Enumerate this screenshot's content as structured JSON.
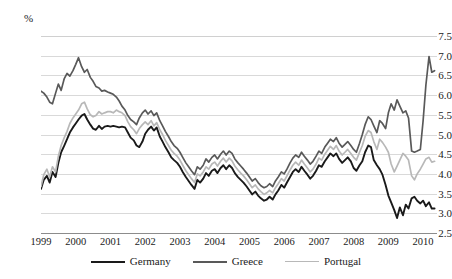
{
  "chart_data": {
    "type": "line",
    "title": "",
    "subtitle": "",
    "xlabel": "",
    "ylabel": "%",
    "unit_label": "%",
    "ylim": [
      2.5,
      7.5
    ],
    "ytick_step": 0.5,
    "yticks": [
      "7.5",
      "7.0",
      "6.5",
      "6.0",
      "5.5",
      "5.0",
      "4.5",
      "4.0",
      "3.5",
      "3.0",
      "2.5"
    ],
    "ytick_values": [
      7.5,
      7.0,
      6.5,
      6.0,
      5.5,
      5.0,
      4.5,
      4.0,
      3.5,
      3.0,
      2.5
    ],
    "xlim": [
      1999,
      2010.4
    ],
    "xticks": [
      "1999",
      "2000",
      "2001",
      "2002",
      "2003",
      "2004",
      "2005",
      "2006",
      "2007",
      "2008",
      "2009",
      "2010"
    ],
    "xtick_values": [
      1999,
      2000,
      2001,
      2002,
      2003,
      2004,
      2005,
      2006,
      2007,
      2008,
      2009,
      2010
    ],
    "grid": true,
    "grid_color": "#d9d9d9",
    "legend_position": "bottom",
    "series": [
      {
        "name": "Germany",
        "color": "#1a1a1a",
        "width": 1.9,
        "x": [
          1999.0,
          1999.08,
          1999.17,
          1999.25,
          1999.33,
          1999.42,
          1999.5,
          1999.58,
          1999.67,
          1999.75,
          1999.83,
          1999.92,
          2000.0,
          2000.08,
          2000.17,
          2000.25,
          2000.33,
          2000.42,
          2000.5,
          2000.58,
          2000.67,
          2000.75,
          2000.83,
          2000.92,
          2001.0,
          2001.08,
          2001.17,
          2001.25,
          2001.33,
          2001.42,
          2001.5,
          2001.58,
          2001.67,
          2001.75,
          2001.83,
          2001.92,
          2002.0,
          2002.08,
          2002.17,
          2002.25,
          2002.33,
          2002.42,
          2002.5,
          2002.58,
          2002.67,
          2002.75,
          2002.83,
          2002.92,
          2003.0,
          2003.08,
          2003.17,
          2003.25,
          2003.33,
          2003.42,
          2003.5,
          2003.58,
          2003.67,
          2003.75,
          2003.83,
          2003.92,
          2004.0,
          2004.08,
          2004.17,
          2004.25,
          2004.33,
          2004.42,
          2004.5,
          2004.58,
          2004.67,
          2004.75,
          2004.83,
          2004.92,
          2005.0,
          2005.08,
          2005.17,
          2005.25,
          2005.33,
          2005.42,
          2005.5,
          2005.58,
          2005.67,
          2005.75,
          2005.83,
          2005.92,
          2006.0,
          2006.08,
          2006.17,
          2006.25,
          2006.33,
          2006.42,
          2006.5,
          2006.58,
          2006.67,
          2006.75,
          2006.83,
          2006.92,
          2007.0,
          2007.08,
          2007.17,
          2007.25,
          2007.33,
          2007.42,
          2007.5,
          2007.58,
          2007.67,
          2007.75,
          2007.83,
          2007.92,
          2008.0,
          2008.08,
          2008.17,
          2008.25,
          2008.33,
          2008.42,
          2008.5,
          2008.58,
          2008.67,
          2008.75,
          2008.83,
          2008.92,
          2009.0,
          2009.08,
          2009.17,
          2009.25,
          2009.33,
          2009.42,
          2009.5,
          2009.58,
          2009.67,
          2009.75,
          2009.83,
          2009.92,
          2010.0,
          2010.08,
          2010.17,
          2010.25,
          2010.33
        ],
        "values": [
          3.62,
          3.85,
          3.95,
          3.78,
          4.05,
          3.92,
          4.28,
          4.55,
          4.72,
          4.88,
          5.05,
          5.18,
          5.28,
          5.38,
          5.48,
          5.52,
          5.38,
          5.25,
          5.15,
          5.12,
          5.22,
          5.14,
          5.2,
          5.22,
          5.2,
          5.22,
          5.2,
          5.18,
          5.2,
          5.18,
          5.05,
          4.92,
          4.85,
          4.72,
          4.68,
          4.82,
          5.02,
          5.12,
          5.2,
          5.1,
          5.18,
          4.95,
          4.82,
          4.68,
          4.55,
          4.42,
          4.35,
          4.28,
          4.18,
          4.05,
          3.92,
          3.82,
          3.72,
          3.62,
          3.85,
          3.78,
          3.88,
          4.02,
          3.95,
          4.08,
          4.12,
          4.02,
          4.15,
          4.22,
          4.12,
          4.22,
          4.15,
          4.02,
          3.92,
          3.85,
          3.78,
          3.68,
          3.58,
          3.48,
          3.55,
          3.45,
          3.38,
          3.32,
          3.35,
          3.42,
          3.35,
          3.48,
          3.58,
          3.72,
          3.65,
          3.78,
          3.92,
          4.05,
          4.12,
          4.05,
          4.18,
          4.08,
          3.98,
          3.88,
          3.95,
          4.08,
          4.22,
          4.18,
          4.32,
          4.42,
          4.52,
          4.45,
          4.52,
          4.38,
          4.28,
          4.35,
          4.42,
          4.32,
          4.15,
          4.08,
          4.22,
          4.32,
          4.55,
          4.72,
          4.68,
          4.35,
          4.22,
          4.12,
          3.98,
          3.72,
          3.45,
          3.28,
          3.08,
          2.88,
          3.15,
          2.95,
          3.22,
          3.12,
          3.38,
          3.42,
          3.32,
          3.25,
          3.32,
          3.18,
          3.28,
          3.12,
          3.12
        ]
      },
      {
        "name": "Greece",
        "color": "#595959",
        "width": 1.7,
        "x": [
          1999.0,
          1999.08,
          1999.17,
          1999.25,
          1999.33,
          1999.42,
          1999.5,
          1999.58,
          1999.67,
          1999.75,
          1999.83,
          1999.92,
          2000.0,
          2000.08,
          2000.17,
          2000.25,
          2000.33,
          2000.42,
          2000.5,
          2000.58,
          2000.67,
          2000.75,
          2000.83,
          2000.92,
          2001.0,
          2001.08,
          2001.17,
          2001.25,
          2001.33,
          2001.42,
          2001.5,
          2001.58,
          2001.67,
          2001.75,
          2001.83,
          2001.92,
          2002.0,
          2002.08,
          2002.17,
          2002.25,
          2002.33,
          2002.42,
          2002.5,
          2002.58,
          2002.67,
          2002.75,
          2002.83,
          2002.92,
          2003.0,
          2003.08,
          2003.17,
          2003.25,
          2003.33,
          2003.42,
          2003.5,
          2003.58,
          2003.67,
          2003.75,
          2003.83,
          2003.92,
          2004.0,
          2004.08,
          2004.17,
          2004.25,
          2004.33,
          2004.42,
          2004.5,
          2004.58,
          2004.67,
          2004.75,
          2004.83,
          2004.92,
          2005.0,
          2005.08,
          2005.17,
          2005.25,
          2005.33,
          2005.42,
          2005.5,
          2005.58,
          2005.67,
          2005.75,
          2005.83,
          2005.92,
          2006.0,
          2006.08,
          2006.17,
          2006.25,
          2006.33,
          2006.42,
          2006.5,
          2006.58,
          2006.67,
          2006.75,
          2006.83,
          2006.92,
          2007.0,
          2007.08,
          2007.17,
          2007.25,
          2007.33,
          2007.42,
          2007.5,
          2007.58,
          2007.67,
          2007.75,
          2007.83,
          2007.92,
          2008.0,
          2008.08,
          2008.17,
          2008.25,
          2008.33,
          2008.42,
          2008.5,
          2008.58,
          2008.67,
          2008.75,
          2008.83,
          2008.92,
          2009.0,
          2009.08,
          2009.17,
          2009.25,
          2009.33,
          2009.42,
          2009.5,
          2009.58,
          2009.67,
          2009.75,
          2009.83,
          2009.92,
          2010.0,
          2010.08,
          2010.17,
          2010.25,
          2010.33
        ],
        "values": [
          6.1,
          6.05,
          5.95,
          5.82,
          5.78,
          6.05,
          6.28,
          6.12,
          6.42,
          6.55,
          6.48,
          6.62,
          6.78,
          6.95,
          6.72,
          6.58,
          6.65,
          6.45,
          6.35,
          6.22,
          6.18,
          6.1,
          6.12,
          6.08,
          6.05,
          6.02,
          5.95,
          5.85,
          5.72,
          5.62,
          5.48,
          5.38,
          5.32,
          5.25,
          5.42,
          5.55,
          5.62,
          5.52,
          5.6,
          5.48,
          5.55,
          5.35,
          5.22,
          5.08,
          4.95,
          4.82,
          4.72,
          4.65,
          4.55,
          4.42,
          4.28,
          4.18,
          4.08,
          3.98,
          4.18,
          4.12,
          4.22,
          4.38,
          4.3,
          4.42,
          4.48,
          4.38,
          4.5,
          4.58,
          4.48,
          4.58,
          4.52,
          4.38,
          4.28,
          4.2,
          4.12,
          4.02,
          3.92,
          3.82,
          3.88,
          3.78,
          3.7,
          3.65,
          3.68,
          3.75,
          3.68,
          3.82,
          3.92,
          4.05,
          4.0,
          4.12,
          4.28,
          4.4,
          4.48,
          4.42,
          4.55,
          4.45,
          4.35,
          4.25,
          4.32,
          4.45,
          4.58,
          4.52,
          4.68,
          4.78,
          4.88,
          4.82,
          4.92,
          4.78,
          4.68,
          4.75,
          4.82,
          4.72,
          4.62,
          4.55,
          4.78,
          5.0,
          5.25,
          5.45,
          5.38,
          5.22,
          5.05,
          5.35,
          5.28,
          5.15,
          5.55,
          5.78,
          5.62,
          5.88,
          5.72,
          5.55,
          5.6,
          5.42,
          4.58,
          4.55,
          4.58,
          4.62,
          5.35,
          6.25,
          6.98,
          6.58,
          6.62
        ]
      },
      {
        "name": "Portugal",
        "color": "#b8b8b8",
        "width": 1.7,
        "x": [
          1999.0,
          1999.08,
          1999.17,
          1999.25,
          1999.33,
          1999.42,
          1999.5,
          1999.58,
          1999.67,
          1999.75,
          1999.83,
          1999.92,
          2000.0,
          2000.08,
          2000.17,
          2000.25,
          2000.33,
          2000.42,
          2000.5,
          2000.58,
          2000.67,
          2000.75,
          2000.83,
          2000.92,
          2001.0,
          2001.08,
          2001.17,
          2001.25,
          2001.33,
          2001.42,
          2001.5,
          2001.58,
          2001.67,
          2001.75,
          2001.83,
          2001.92,
          2002.0,
          2002.08,
          2002.17,
          2002.25,
          2002.33,
          2002.42,
          2002.5,
          2002.58,
          2002.67,
          2002.75,
          2002.83,
          2002.92,
          2003.0,
          2003.08,
          2003.17,
          2003.25,
          2003.33,
          2003.42,
          2003.5,
          2003.58,
          2003.67,
          2003.75,
          2003.83,
          2003.92,
          2004.0,
          2004.08,
          2004.17,
          2004.25,
          2004.33,
          2004.42,
          2004.5,
          2004.58,
          2004.67,
          2004.75,
          2004.83,
          2004.92,
          2005.0,
          2005.08,
          2005.17,
          2005.25,
          2005.33,
          2005.42,
          2005.5,
          2005.58,
          2005.67,
          2005.75,
          2005.83,
          2005.92,
          2006.0,
          2006.08,
          2006.17,
          2006.25,
          2006.33,
          2006.42,
          2006.5,
          2006.58,
          2006.67,
          2006.75,
          2006.83,
          2006.92,
          2007.0,
          2007.08,
          2007.17,
          2007.25,
          2007.33,
          2007.42,
          2007.5,
          2007.58,
          2007.67,
          2007.75,
          2007.83,
          2007.92,
          2008.0,
          2008.08,
          2008.17,
          2008.25,
          2008.33,
          2008.42,
          2008.5,
          2008.58,
          2008.67,
          2008.75,
          2008.83,
          2008.92,
          2009.0,
          2009.08,
          2009.17,
          2009.25,
          2009.33,
          2009.42,
          2009.5,
          2009.58,
          2009.67,
          2009.75,
          2009.83,
          2009.92,
          2010.0,
          2010.08,
          2010.17,
          2010.25,
          2010.33
        ],
        "values": [
          3.68,
          3.98,
          4.12,
          3.92,
          4.18,
          4.05,
          4.45,
          4.72,
          4.92,
          5.08,
          5.28,
          5.42,
          5.52,
          5.62,
          5.78,
          5.82,
          5.65,
          5.5,
          5.45,
          5.48,
          5.58,
          5.52,
          5.55,
          5.58,
          5.58,
          5.55,
          5.62,
          5.58,
          5.55,
          5.48,
          5.32,
          5.2,
          5.12,
          5.02,
          5.15,
          5.25,
          5.32,
          5.25,
          5.35,
          5.22,
          5.3,
          5.12,
          5.0,
          4.85,
          4.72,
          4.6,
          4.52,
          4.45,
          4.35,
          4.22,
          4.08,
          3.98,
          3.88,
          3.78,
          4.0,
          3.95,
          4.05,
          4.18,
          4.12,
          4.25,
          4.3,
          4.2,
          4.32,
          4.4,
          4.3,
          4.4,
          4.33,
          4.2,
          4.1,
          4.02,
          3.95,
          3.85,
          3.75,
          3.65,
          3.72,
          3.62,
          3.55,
          3.48,
          3.52,
          3.58,
          3.52,
          3.65,
          3.75,
          3.88,
          3.82,
          3.95,
          4.1,
          4.22,
          4.3,
          4.22,
          4.35,
          4.25,
          4.15,
          4.05,
          4.12,
          4.25,
          4.4,
          4.35,
          4.5,
          4.6,
          4.7,
          4.62,
          4.72,
          4.58,
          4.48,
          4.55,
          4.62,
          4.52,
          4.42,
          4.35,
          4.55,
          4.72,
          4.95,
          5.1,
          5.05,
          4.82,
          4.62,
          4.88,
          4.8,
          4.68,
          4.55,
          4.25,
          4.05,
          4.2,
          4.35,
          4.52,
          4.45,
          4.35,
          3.95,
          3.85,
          4.0,
          4.12,
          4.25,
          4.38,
          4.42,
          4.3,
          4.32
        ]
      }
    ]
  },
  "legend": {
    "items": [
      {
        "label": "Germany",
        "color": "#1a1a1a",
        "thickness": "2.4px"
      },
      {
        "label": "Greece",
        "color": "#595959",
        "thickness": "2.2px"
      },
      {
        "label": "Portugal",
        "color": "#b8b8b8",
        "thickness": "1.8px"
      }
    ]
  }
}
